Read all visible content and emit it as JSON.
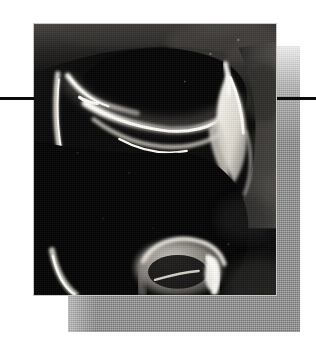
{
  "figure": {
    "kind": "medical-imaging-figure",
    "modality_label": "MRI",
    "subject_label": "knee joint sagittal section",
    "caption": "",
    "label": "",
    "annotations": [],
    "visible_text": [],
    "canvas": {
      "width": 316,
      "height": 347,
      "background_color": "#ffffff"
    },
    "photo": {
      "name": "mri-knee-sagittal",
      "x": 33,
      "y": 23,
      "width": 244,
      "height": 273,
      "border_color": "#c9c9c9",
      "base_color": "#050505",
      "highlight_color": "#f4f2ee",
      "midtone_color": "#6d6a66",
      "description": "High-contrast greyscale sagittal MRI of a knee. A bright curvilinear band sweeps across the upper third marking the femoral condyle cartilage and joint space; a bright wedge sits at the upper right; a bright vertical streak runs down the left margin; a bright rounded structure with a fluid-bright notch sits at the bottom centre. The remainder of the field is near-black."
    },
    "shadow_plate": {
      "name": "offset-grey-plate",
      "x": 68,
      "y": 46,
      "width": 232,
      "height": 286,
      "color": "#8f8f8f",
      "texture": "halftone-screen"
    },
    "rules": [
      {
        "name": "rule-left",
        "x": 0,
        "y": 97,
        "width": 34,
        "height": 3,
        "color": "#0b0b0b"
      },
      {
        "name": "rule-right",
        "x": 277,
        "y": 97,
        "width": 39,
        "height": 3,
        "color": "#0b0b0b"
      }
    ]
  }
}
